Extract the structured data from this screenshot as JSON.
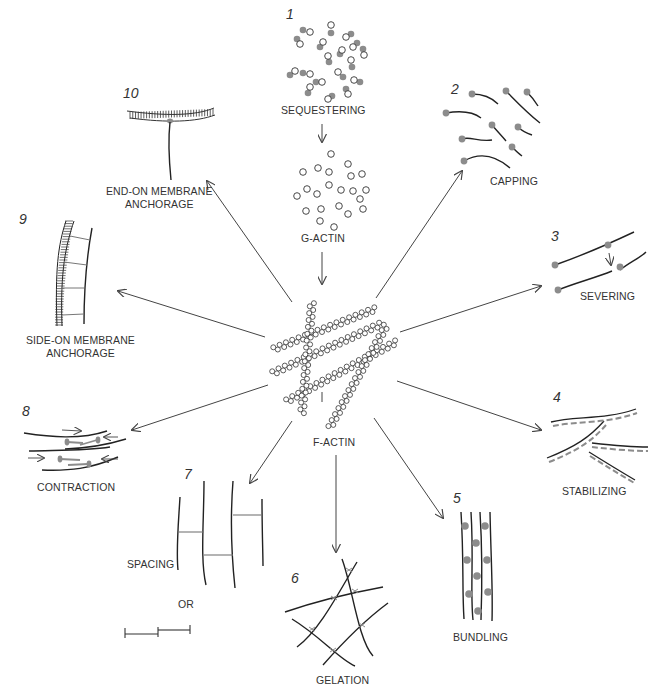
{
  "diagram": {
    "center": {
      "label": "F-ACTIN"
    },
    "source": {
      "label": "G-ACTIN"
    },
    "colors": {
      "line": "#2a2a2a",
      "protein": "#8c8c8c",
      "arrow": "#444444"
    },
    "functions": [
      {
        "number": "1",
        "label": "SEQUESTERING"
      },
      {
        "number": "2",
        "label": "CAPPING"
      },
      {
        "number": "3",
        "label": "SEVERING"
      },
      {
        "number": "4",
        "label": "STABILIZING"
      },
      {
        "number": "5",
        "label": "BUNDLING"
      },
      {
        "number": "6",
        "label": "GELATION"
      },
      {
        "number": "7",
        "label": "SPACING",
        "alt_label": "OR"
      },
      {
        "number": "8",
        "label": "CONTRACTION"
      },
      {
        "number": "9",
        "label_line1": "SIDE-ON MEMBRANE",
        "label_line2": "ANCHORAGE"
      },
      {
        "number": "10",
        "label_line1": "END-ON MEMBRANE",
        "label_line2": "ANCHORAGE"
      }
    ]
  }
}
